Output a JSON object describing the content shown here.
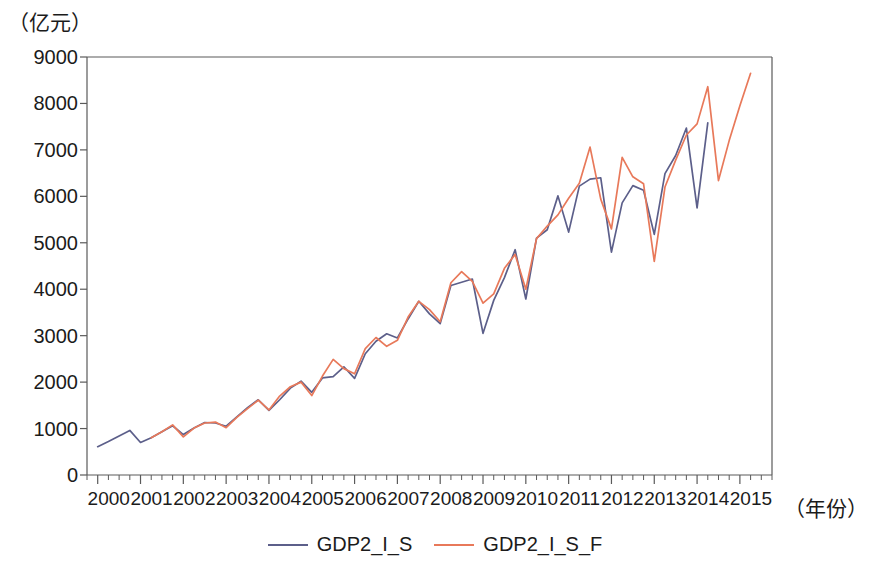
{
  "chart_data": {
    "type": "line",
    "title": "",
    "subtitle": "",
    "ylabel": "（亿元）",
    "xlabel": "（年份）",
    "ylim": [
      0,
      9000
    ],
    "ytick_values": [
      0,
      1000,
      2000,
      3000,
      4000,
      5000,
      6000,
      7000,
      8000,
      9000
    ],
    "ytick_labels": [
      "0",
      "1000",
      "2000",
      "3000",
      "4000",
      "5000",
      "6000",
      "7000",
      "8000",
      "9000"
    ],
    "xlim": [
      1999.75,
      2015.75
    ],
    "xtick_labels": [
      "2000",
      "2001",
      "2002",
      "2003",
      "2004",
      "2005",
      "2006",
      "2007",
      "2008",
      "2009",
      "2010",
      "2011",
      "2012",
      "2013",
      "2014",
      "2015"
    ],
    "xtick_values": [
      2000,
      2001,
      2002,
      2003,
      2004,
      2005,
      2006,
      2007,
      2008,
      2009,
      2010,
      2011,
      2012,
      2013,
      2014,
      2015
    ],
    "minor_ticks_per_year": 4,
    "grid": false,
    "legend_position": "bottom-center",
    "x": [
      2000.0,
      2000.25,
      2000.5,
      2000.75,
      2001.0,
      2001.25,
      2001.5,
      2001.75,
      2002.0,
      2002.25,
      2002.5,
      2002.75,
      2003.0,
      2003.25,
      2003.5,
      2003.75,
      2004.0,
      2004.25,
      2004.5,
      2004.75,
      2005.0,
      2005.25,
      2005.5,
      2005.75,
      2006.0,
      2006.25,
      2006.5,
      2006.75,
      2007.0,
      2007.25,
      2007.5,
      2007.75,
      2008.0,
      2008.25,
      2008.5,
      2008.75,
      2009.0,
      2009.25,
      2009.5,
      2009.75,
      2010.0,
      2010.25,
      2010.5,
      2010.75,
      2011.0,
      2011.25,
      2011.5,
      2011.75,
      2012.0,
      2012.25,
      2012.5,
      2012.75,
      2013.0,
      2013.25,
      2013.5,
      2013.75,
      2014.0,
      2014.25,
      2014.5,
      2014.75,
      2015.0,
      2015.25
    ],
    "series": [
      {
        "name": "GDP2_I_S",
        "color": "#5c5f8a",
        "values": [
          610,
          720,
          840,
          960,
          700,
          800,
          930,
          1060,
          870,
          1010,
          1130,
          1120,
          1050,
          1250,
          1450,
          1620,
          1390,
          1620,
          1870,
          2020,
          1780,
          2090,
          2120,
          2330,
          2080,
          2610,
          2880,
          3040,
          2950,
          3360,
          3740,
          3470,
          3260,
          4080,
          4150,
          4220,
          3050,
          3760,
          4250,
          4850,
          3790,
          5100,
          5280,
          6010,
          5230,
          6220,
          6370,
          6400,
          4800,
          5860,
          6230,
          6130,
          5180,
          6490,
          6880,
          7470,
          5750,
          7580,
          null,
          null,
          null,
          null
        ]
      },
      {
        "name": "GDP2_I_S_F",
        "color": "#e8795a",
        "values": [
          null,
          null,
          null,
          null,
          null,
          800,
          930,
          1080,
          820,
          1010,
          1120,
          1140,
          1020,
          1240,
          1430,
          1610,
          1400,
          1700,
          1900,
          2000,
          1710,
          2130,
          2490,
          2290,
          2180,
          2720,
          2960,
          2770,
          2900,
          3400,
          3740,
          3560,
          3300,
          4140,
          4380,
          4170,
          3700,
          3900,
          4450,
          4750,
          4000,
          5090,
          5360,
          5600,
          5960,
          6280,
          7060,
          5940,
          5300,
          6840,
          6420,
          6270,
          4600,
          6200,
          6780,
          7320,
          7560,
          8360,
          6340,
          7200,
          7950,
          8650
        ]
      }
    ],
    "legend": [
      {
        "label": "GDP2_I_S",
        "color": "#5c5f8a"
      },
      {
        "label": "GDP2_I_S_F",
        "color": "#e8795a"
      }
    ],
    "axis_color": "#5a5a5a",
    "plot_box": {
      "left": 87,
      "top": 57,
      "right": 772,
      "bottom": 475
    }
  }
}
